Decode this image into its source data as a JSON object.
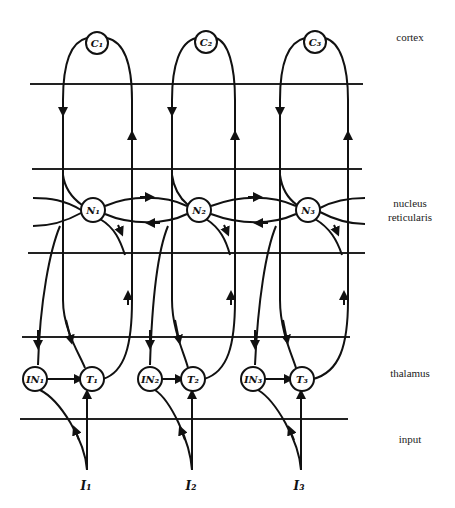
{
  "regions": {
    "cortex": "cortex",
    "nucleus_line1": "nucleus",
    "nucleus_line2": "reticularis",
    "thalamus": "thalamus",
    "input": "input"
  },
  "nodes": {
    "cortex": [
      "C1",
      "C2",
      "C3"
    ],
    "reticular": [
      "N1",
      "N2",
      "N3"
    ],
    "interneurons": [
      "IN1",
      "IN2",
      "IN3"
    ],
    "thalamic": [
      "T1",
      "T2",
      "T3"
    ],
    "inputs": [
      "I1",
      "I2",
      "I3"
    ]
  },
  "node_labels": {
    "C1": "C₁",
    "C2": "C₂",
    "C3": "C₃",
    "N1": "N₁",
    "N2": "N₂",
    "N3": "N₃",
    "IN1": "IN₁",
    "IN2": "IN₂",
    "IN3": "IN₃",
    "T1": "T₁",
    "T2": "T₂",
    "T3": "T₃",
    "I1": "I₁",
    "I2": "I₂",
    "I3": "I₃"
  }
}
